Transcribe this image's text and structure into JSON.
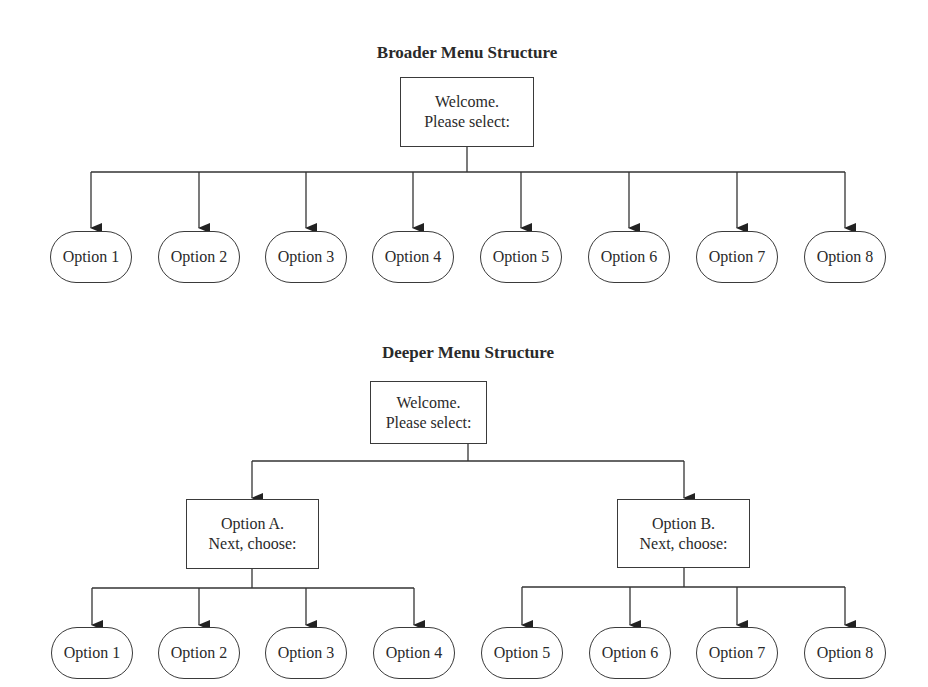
{
  "broader": {
    "title": "Broader Menu Structure",
    "root": {
      "line1": "Welcome.",
      "line2": "Please select:"
    },
    "options": [
      "Option 1",
      "Option 2",
      "Option 3",
      "Option 4",
      "Option 5",
      "Option 6",
      "Option 7",
      "Option 8"
    ]
  },
  "deeper": {
    "title": "Deeper Menu Structure",
    "root": {
      "line1": "Welcome.",
      "line2": "Please select:"
    },
    "branch_a": {
      "line1": "Option A.",
      "line2": "Next, choose:"
    },
    "branch_b": {
      "line1": "Option B.",
      "line2": "Next, choose:"
    },
    "options_a": [
      "Option 1",
      "Option 2",
      "Option 3",
      "Option 4"
    ],
    "options_b": [
      "Option 5",
      "Option 6",
      "Option 7",
      "Option 8"
    ]
  }
}
